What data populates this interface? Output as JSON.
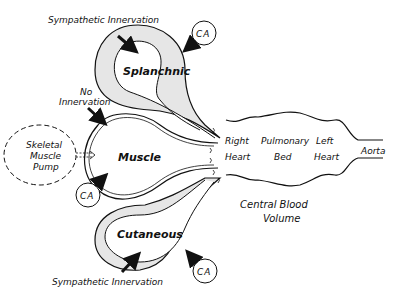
{
  "diagram": {
    "compartments": {
      "splanchnic": {
        "label": "Splanchnic",
        "innervation": "Sympathetic Innervation",
        "control": "CA"
      },
      "muscle": {
        "label": "Muscle",
        "innervation_line1": "No",
        "innervation_line2": "Innervation",
        "control": "CA"
      },
      "cutaneous": {
        "label": "Cutaneous",
        "innervation": "Sympathetic Innervation",
        "control": "CA"
      }
    },
    "pump": {
      "line1": "Skeletal",
      "line2": "Muscle",
      "line3": "Pump"
    },
    "central": {
      "right_heart_1": "Right",
      "right_heart_2": "Heart",
      "pulmonary_1": "Pulmonary",
      "pulmonary_2": "Bed",
      "left_heart_1": "Left",
      "left_heart_2": "Heart",
      "aorta": "Aorta",
      "volume_1": "Central Blood",
      "volume_2": "Volume"
    },
    "colors": {
      "line": "#111111",
      "fill": "#e6e6e6",
      "background": "#ffffff"
    }
  }
}
